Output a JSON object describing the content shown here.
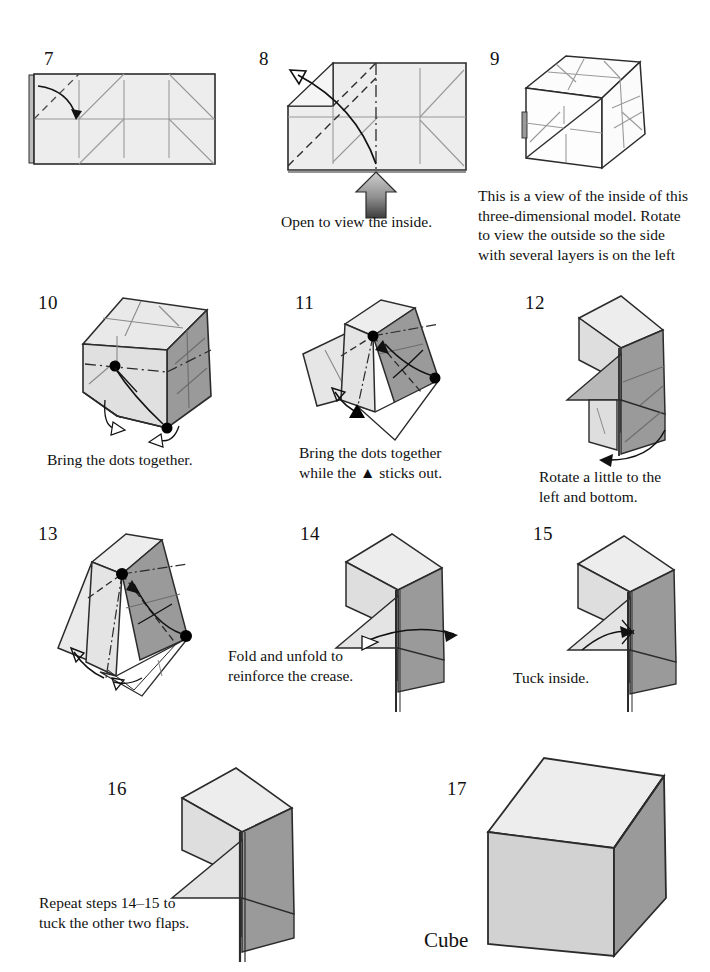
{
  "document": {
    "kind": "origami-instruction-diagram",
    "model_name": "Cube",
    "page_background": "#ffffff",
    "ink_color": "#1a1a1a"
  },
  "palette": {
    "paper_front": "#ededed",
    "paper_front_alt": "#e4e4e4",
    "paper_back_shaded": "#9a9a9a",
    "paper_mid": "#c9c9c9",
    "paper_light": "#dcdcdc",
    "outline": "#2b2b2b",
    "crease_line": "#8a8a8a",
    "dot_color": "#000000",
    "arrow_color": "#111111"
  },
  "steps": [
    {
      "number": "7",
      "num_pos": {
        "x": 44,
        "y": 48
      },
      "caption": "",
      "caption_pos": {
        "x": 0,
        "y": 0
      },
      "figure_type": "flat-rectangle-with-creases"
    },
    {
      "number": "8",
      "num_pos": {
        "x": 259,
        "y": 48
      },
      "caption": "Open to view the inside.",
      "caption_pos": {
        "x": 281,
        "y": 212
      },
      "figure_type": "flat-rectangle-open-arrow"
    },
    {
      "number": "9",
      "num_pos": {
        "x": 490,
        "y": 48
      },
      "caption": "This is a view of the inside of this\nthree-dimensional model. Rotate\nto view the outside so the side\nwith several layers is on the left",
      "caption_pos": {
        "x": 478,
        "y": 186
      },
      "figure_type": "wireframe-cube-inside"
    },
    {
      "number": "10",
      "num_pos": {
        "x": 38,
        "y": 292
      },
      "caption": "Bring the dots together.",
      "caption_pos": {
        "x": 47,
        "y": 450
      },
      "figure_type": "shaded-cube-two-dots"
    },
    {
      "number": "11",
      "num_pos": {
        "x": 295,
        "y": 292
      },
      "caption": "Bring the dots together\nwhile the ▲ sticks out.",
      "caption_pos": {
        "x": 299,
        "y": 443
      },
      "figure_type": "tilted-cube-dots-triangle"
    },
    {
      "number": "12",
      "num_pos": {
        "x": 525,
        "y": 292
      },
      "caption": "Rotate a little to the\nleft and bottom.",
      "caption_pos": {
        "x": 539,
        "y": 467
      },
      "figure_type": "upright-box-rotate-arrow"
    },
    {
      "number": "13",
      "num_pos": {
        "x": 38,
        "y": 523
      },
      "caption": "",
      "caption_pos": {
        "x": 0,
        "y": 0
      },
      "figure_type": "tilted-cube-dots-arrows"
    },
    {
      "number": "14",
      "num_pos": {
        "x": 300,
        "y": 523
      },
      "caption": "Fold and unfold to\nreinforce the crease.",
      "caption_pos": {
        "x": 228,
        "y": 646
      },
      "figure_type": "upright-box-fold-arrow"
    },
    {
      "number": "15",
      "num_pos": {
        "x": 533,
        "y": 523
      },
      "caption": "Tuck inside.",
      "caption_pos": {
        "x": 513,
        "y": 668
      },
      "figure_type": "upright-box-tuck-arrow"
    },
    {
      "number": "16",
      "num_pos": {
        "x": 107,
        "y": 778
      },
      "caption": "Repeat steps 14–15 to\ntuck the other two flaps.",
      "caption_pos": {
        "x": 39,
        "y": 893
      },
      "figure_type": "upright-box-one-flap"
    },
    {
      "number": "17",
      "num_pos": {
        "x": 447,
        "y": 778
      },
      "caption": "",
      "caption_pos": {
        "x": 0,
        "y": 0
      },
      "figure_type": "finished-cube"
    }
  ],
  "final": {
    "label": "Cube",
    "label_pos": {
      "x": 424,
      "y": 928
    }
  }
}
